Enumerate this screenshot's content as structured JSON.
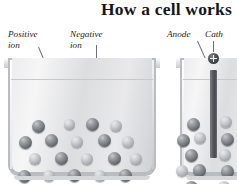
{
  "figure": {
    "title": "How a cell works",
    "labels": {
      "positive_ion_line1": "Positive",
      "positive_ion_line2": "ion",
      "negative_ion_line1": "Negative",
      "negative_ion_line2": "ion",
      "anode": "Anode",
      "cathode": "Cath"
    }
  },
  "colors": {
    "title_text": "#16161a",
    "label_text": "#1c1c20",
    "glass": "#b9bcc0",
    "liquid": "#e9e9eb",
    "ion_dark": "#74777c",
    "ion_light": "#adb0b4",
    "electrode": "#45484c",
    "terminal": "#2a2c30",
    "leader_line": "#70707a",
    "background": "#ffffff"
  },
  "beakers": [
    {
      "name": "left-beaker",
      "x": 8,
      "y": 58,
      "width": 148,
      "height": 118,
      "has_electrode": false,
      "ions": [
        {
          "x": 30,
          "y": 68,
          "r": 6.5,
          "shade": "dark"
        },
        {
          "x": 61,
          "y": 66,
          "r": 5.5,
          "shade": "light"
        },
        {
          "x": 84,
          "y": 66,
          "r": 6.5,
          "shade": "dark"
        },
        {
          "x": 108,
          "y": 68,
          "r": 6.0,
          "shade": "light"
        },
        {
          "x": 17,
          "y": 84,
          "r": 6.5,
          "shade": "dark"
        },
        {
          "x": 43,
          "y": 82,
          "r": 6.5,
          "shade": "dark"
        },
        {
          "x": 69,
          "y": 84,
          "r": 6.0,
          "shade": "light"
        },
        {
          "x": 96,
          "y": 82,
          "r": 6.5,
          "shade": "dark"
        },
        {
          "x": 120,
          "y": 84,
          "r": 6.0,
          "shade": "light"
        },
        {
          "x": 27,
          "y": 101,
          "r": 6.0,
          "shade": "light"
        },
        {
          "x": 53,
          "y": 100,
          "r": 6.5,
          "shade": "dark"
        },
        {
          "x": 79,
          "y": 101,
          "r": 6.0,
          "shade": "light"
        },
        {
          "x": 106,
          "y": 100,
          "r": 6.5,
          "shade": "dark"
        },
        {
          "x": 128,
          "y": 101,
          "r": 6.0,
          "shade": "light"
        },
        {
          "x": 16,
          "y": 118,
          "r": 6.5,
          "shade": "dark"
        },
        {
          "x": 41,
          "y": 118,
          "r": 6.0,
          "shade": "light"
        },
        {
          "x": 66,
          "y": 117,
          "r": 6.5,
          "shade": "dark"
        },
        {
          "x": 92,
          "y": 118,
          "r": 6.0,
          "shade": "light"
        },
        {
          "x": 117,
          "y": 117,
          "r": 6.5,
          "shade": "dark"
        },
        {
          "x": 28,
          "y": 135,
          "r": 6.0,
          "shade": "light"
        },
        {
          "x": 54,
          "y": 134,
          "r": 6.5,
          "shade": "dark"
        },
        {
          "x": 80,
          "y": 135,
          "r": 6.0,
          "shade": "light"
        },
        {
          "x": 105,
          "y": 134,
          "r": 6.5,
          "shade": "dark"
        },
        {
          "x": 127,
          "y": 135,
          "r": 6.0,
          "shade": "light"
        }
      ]
    },
    {
      "name": "right-beaker",
      "x": 180,
      "y": 58,
      "width": 90,
      "height": 118,
      "has_electrode": true,
      "electrode": {
        "x": 30,
        "y": 12,
        "width": 7,
        "height": 88
      },
      "terminal": {
        "x": 28,
        "y": -5
      },
      "ions": [
        {
          "x": 13,
          "y": 66,
          "r": 6.5,
          "shade": "dark"
        },
        {
          "x": 46,
          "y": 64,
          "r": 6.0,
          "shade": "light"
        },
        {
          "x": 3,
          "y": 82,
          "r": 6.5,
          "shade": "dark"
        },
        {
          "x": 20,
          "y": 80,
          "r": 6.0,
          "shade": "light"
        },
        {
          "x": 47,
          "y": 81,
          "r": 6.5,
          "shade": "dark"
        },
        {
          "x": 11,
          "y": 97,
          "r": 6.5,
          "shade": "dark"
        },
        {
          "x": 45,
          "y": 97,
          "r": 6.0,
          "shade": "light"
        },
        {
          "x": 2,
          "y": 113,
          "r": 6.0,
          "shade": "light"
        },
        {
          "x": 19,
          "y": 112,
          "r": 6.5,
          "shade": "dark"
        },
        {
          "x": 47,
          "y": 113,
          "r": 6.5,
          "shade": "dark"
        },
        {
          "x": 11,
          "y": 129,
          "r": 6.5,
          "shade": "dark"
        },
        {
          "x": 44,
          "y": 129,
          "r": 6.0,
          "shade": "light"
        },
        {
          "x": 14,
          "y": 146,
          "r": 6.0,
          "shade": "light"
        },
        {
          "x": 42,
          "y": 146,
          "r": 6.5,
          "shade": "dark"
        }
      ]
    }
  ]
}
